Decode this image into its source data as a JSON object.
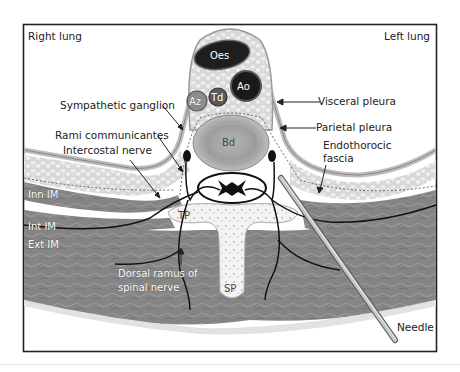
{
  "figure": {
    "colors": {
      "frame": "#222222",
      "background": "#ffffff",
      "muscle": "#8a8a8a",
      "muscle_dark": "#6f6f6f",
      "fat": "#dcdcdc",
      "bone": "#f1f1f1",
      "organ_dark": "#1e1e1e",
      "needle": "#b5b5b5"
    },
    "labels": {
      "right_lung": "Right lung",
      "left_lung": "Left lung",
      "sympathetic_ganglion": "Sympathetic ganglion",
      "rami_communicantes": "Rami communicantes",
      "intercostal_nerve": "Intercostal nerve",
      "visceral_pleura": "Visceral pleura",
      "parietal_pleura": "Parietal pleura",
      "endothoracic_fascia_line1": "Endothorocic",
      "endothoracic_fascia_line2": "fascia",
      "inn_im": "Inn IM",
      "int_im": "Int IM",
      "ext_im": "Ext IM",
      "dorsal_ramus_line1": "Dorsal ramus of",
      "dorsal_ramus_line2": "spinal nerve",
      "needle": "Needle"
    },
    "structures": {
      "oes": "Oes",
      "ao": "Ao",
      "az": "Az",
      "td": "Td",
      "bd": "Bd",
      "tp": "TP",
      "sp": "SP"
    }
  }
}
